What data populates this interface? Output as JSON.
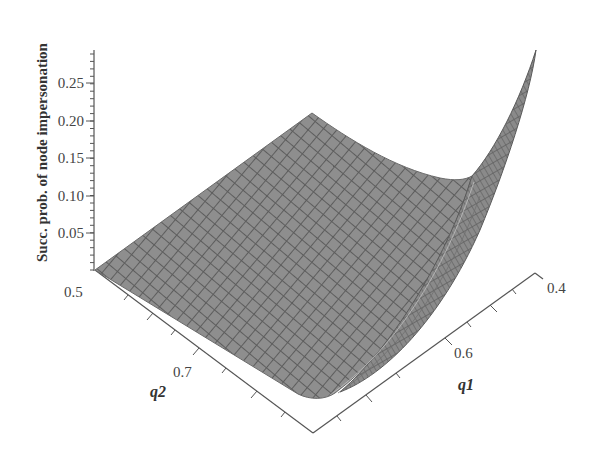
{
  "chart_data": {
    "type": "surface3d",
    "title": "",
    "zlabel": "Succ. prob. of node impersonation",
    "xlabel": "q1",
    "ylabel": "q2",
    "z_ticks": [
      "0.05",
      "0.10",
      "0.15",
      "0.20",
      "0.25"
    ],
    "z_tick_values": [
      0.05,
      0.1,
      0.15,
      0.2,
      0.25
    ],
    "zlim": [
      0,
      0.29
    ],
    "q1_ticks": [
      "0.4",
      "0.6"
    ],
    "q1_tick_values": [
      0.4,
      0.6
    ],
    "q1_range": [
      0.4,
      0.75
    ],
    "q2_ticks": [
      "0.5",
      "0.7"
    ],
    "q2_tick_values": [
      0.5,
      0.7
    ],
    "q2_range": [
      0.5,
      0.8
    ],
    "surface_description": "Surface is ~0 over most of the domain, rising steeply to ~0.29 as q1 approaches 0.4 with q2 at its far end; moderate lift (~0.09) along the q2=0.5 edge at low q1",
    "sample_points": [
      {
        "q1": 0.75,
        "q2": 0.5,
        "z": 0.0
      },
      {
        "q1": 0.4,
        "q2": 0.5,
        "z": 0.09
      },
      {
        "q1": 0.75,
        "q2": 0.8,
        "z": 0.0
      },
      {
        "q1": 0.4,
        "q2": 0.8,
        "z": 0.29
      },
      {
        "q1": 0.45,
        "q2": 0.8,
        "z": 0.1
      }
    ],
    "colors": {
      "surface_fill": "#8a8a8a",
      "mesh_line": "#5e5e5e",
      "axis": "#555555",
      "background": "#ffffff"
    },
    "grid": false,
    "legend": null
  }
}
